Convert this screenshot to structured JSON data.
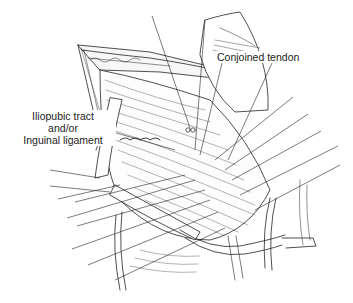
{
  "figure": {
    "type": "surgical anatomy line illustration",
    "style": "black-and-white pen-and-ink",
    "labels": {
      "conjoined_tendon": "Conjoined tendon",
      "iliopubic_tract_line1": "Iliopubic tract",
      "iliopubic_tract_line2": "and/or",
      "iliopubic_tract_line3": "Inguinal ligament"
    },
    "colors": {
      "ink": "#222222",
      "background": "#ffffff"
    }
  }
}
